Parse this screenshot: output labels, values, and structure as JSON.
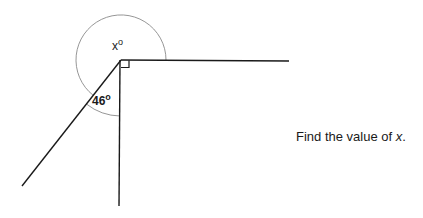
{
  "diagram": {
    "vertex": {
      "x": 121,
      "y": 60
    },
    "lines": [
      {
        "name": "horizontal-ray",
        "x1": 121,
        "y1": 60,
        "x2": 289,
        "y2": 61
      },
      {
        "name": "vertical-ray",
        "x1": 120,
        "y1": 60,
        "x2": 119,
        "y2": 206
      },
      {
        "name": "slanted-ray",
        "x1": 121,
        "y1": 60,
        "x2": 22,
        "y2": 186
      }
    ],
    "angles": {
      "reflex": {
        "label": "x",
        "degree_symbol": "o"
      },
      "acute": {
        "label": "46",
        "degree_symbol": "o"
      },
      "right_angle_marker": true
    },
    "colors": {
      "line": "#1a1a1a",
      "arc": "#7a7a7a"
    }
  },
  "question": {
    "prefix": "Find the value of ",
    "variable": "x",
    "suffix": "."
  }
}
